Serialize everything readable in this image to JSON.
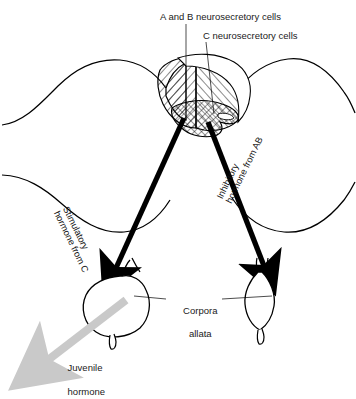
{
  "figure": {
    "background_color": "#ffffff",
    "ink_color": "#000000",
    "juvenile_arrow_color": "#c9c9c9"
  },
  "labels": {
    "ab_cells": "A and B neurosecretory cells",
    "c_cells": "C neurosecretory cells",
    "corpora_line1": "Corpora",
    "corpora_line2": "allata",
    "juvenile_line1": "Juvenile",
    "juvenile_line2": "hormone"
  },
  "arrow_labels": {
    "stimulatory": "Stimulatory\nhormone from C",
    "inhibitory": "Inhibitory\nhormone from AB"
  },
  "structures": {
    "brain_left_lobe": "hatched-lobe-left",
    "brain_right_lobe": "hatched-lobe-right",
    "center_cells": "cross-hatched-c-cells",
    "gland_left": "corpus-allatum-left",
    "gland_right": "corpus-allatum-right"
  }
}
